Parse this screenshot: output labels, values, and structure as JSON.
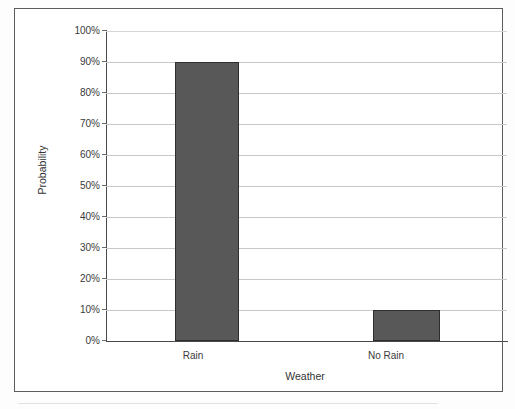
{
  "chart_data": {
    "type": "bar",
    "title": "",
    "subtitle": "",
    "xlabel": "Weather",
    "ylabel": "Probability",
    "categories": [
      "Rain",
      "No Rain"
    ],
    "values": [
      0.9,
      0.1
    ],
    "value_labels": [
      "90%",
      "10%"
    ],
    "series": [
      {
        "name": "Probability",
        "values": [
          0.9,
          0.1
        ]
      }
    ],
    "ylim": [
      0,
      1
    ],
    "ytick_labels": [
      "0%",
      "10%",
      "20%",
      "30%",
      "40%",
      "50%",
      "60%",
      "70%",
      "80%",
      "90%",
      "100%"
    ],
    "ytick_values": [
      0,
      0.1,
      0.2,
      0.3,
      0.4,
      0.5,
      0.6,
      0.7,
      0.8,
      0.9,
      1.0
    ],
    "grid": true,
    "grid_axis": "y",
    "legend": false,
    "legend_position": "none",
    "bar_color": "#585858",
    "bar_edge_color": "#2e2e2e",
    "gridline_color": "#c8c8c8",
    "axis_color": "#4a4a4a",
    "frame_color": "#5d5d5d",
    "background_color": "#ffffff"
  }
}
